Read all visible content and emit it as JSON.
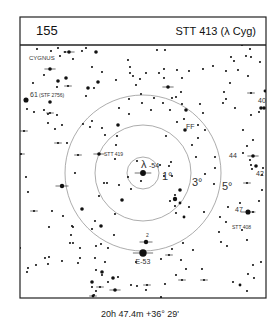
{
  "header": {
    "chart_number": "155",
    "title": "STT 413 (λ Cyg)"
  },
  "frame": {
    "left": 20,
    "top": 17,
    "right": 266,
    "header_bottom": 45,
    "bottom": 298
  },
  "center": {
    "x": 143,
    "y": 173
  },
  "circles": [
    {
      "label": "1°",
      "r": 16,
      "label_x": 162,
      "label_y": 180,
      "size": 11
    },
    {
      "label": "3°",
      "r": 48,
      "label_x": 192,
      "label_y": 186,
      "size": 11
    },
    {
      "label": "5°",
      "r": 78,
      "label_x": 222,
      "label_y": 190,
      "size": 11
    }
  ],
  "constellation_label": {
    "text": "CYGNUS",
    "x": 29,
    "y": 60
  },
  "labels": [
    {
      "text": "λ",
      "x": 141,
      "y": 168,
      "size": 11
    },
    {
      "text": "-54",
      "x": 149,
      "y": 168,
      "size": 7
    },
    {
      "text": "61",
      "x": 30,
      "y": 97,
      "size": 7
    },
    {
      "text": "(STF 2756)",
      "x": 39,
      "y": 97,
      "size": 5
    },
    {
      "text": "STT 419",
      "x": 104,
      "y": 156,
      "size": 5
    },
    {
      "text": "FF",
      "x": 186,
      "y": 129,
      "size": 7
    },
    {
      "text": "40",
      "x": 258,
      "y": 103,
      "size": 7
    },
    {
      "text": "44",
      "x": 229,
      "y": 158,
      "size": 7
    },
    {
      "text": "42",
      "x": 256,
      "y": 176,
      "size": 7
    },
    {
      "text": "47",
      "x": 235,
      "y": 212,
      "size": 7
    },
    {
      "text": "STT 408",
      "x": 232,
      "y": 229,
      "size": 5
    },
    {
      "text": "E-53",
      "x": 143,
      "y": 264,
      "size": 7,
      "anchor": "middle"
    },
    {
      "text": "2",
      "x": 146,
      "y": 237,
      "size": 5
    }
  ],
  "stars": [
    [
      143,
      173,
      3.5,
      1
    ],
    [
      141,
      181,
      1,
      0
    ],
    [
      137,
      161,
      1,
      0
    ],
    [
      128,
      177,
      1,
      0
    ],
    [
      160,
      165,
      1,
      0
    ],
    [
      172,
      176,
      1,
      0
    ],
    [
      164,
      176,
      1,
      0
    ],
    [
      171,
      162,
      1,
      0
    ],
    [
      169,
      166,
      1,
      0
    ],
    [
      131,
      189,
      1,
      0
    ],
    [
      119,
      185,
      1,
      0
    ],
    [
      107,
      183,
      1,
      0
    ],
    [
      122,
      200,
      2,
      0
    ],
    [
      99,
      196,
      1,
      0
    ],
    [
      115,
      214,
      1,
      0
    ],
    [
      62,
      186,
      2.5,
      1
    ],
    [
      82,
      209,
      2,
      0
    ],
    [
      63,
      216,
      1,
      0
    ],
    [
      52,
      211,
      1,
      0
    ],
    [
      34,
      211,
      1,
      1
    ],
    [
      49,
      227,
      1,
      0
    ],
    [
      73,
      227,
      1,
      0
    ],
    [
      71,
      235,
      1,
      0
    ],
    [
      72,
      226,
      1,
      0
    ],
    [
      101,
      226,
      2,
      0
    ],
    [
      114,
      235,
      1,
      0
    ],
    [
      92,
      229,
      1,
      0
    ],
    [
      95,
      221,
      1,
      0
    ],
    [
      104,
      183,
      1,
      0
    ],
    [
      115,
      159,
      1,
      0
    ],
    [
      99,
      154,
      2,
      1
    ],
    [
      180,
      190,
      2,
      0
    ],
    [
      175,
      199,
      2.5,
      0
    ],
    [
      180,
      203,
      1.5,
      0
    ],
    [
      175,
      206,
      1,
      0
    ],
    [
      170,
      201,
      1,
      0
    ],
    [
      175,
      195,
      1,
      0
    ],
    [
      189,
      207,
      1,
      0
    ],
    [
      184,
      217,
      1.5,
      0
    ],
    [
      176,
      213,
      1,
      0
    ],
    [
      204,
      212,
      1,
      0
    ],
    [
      205,
      174,
      1,
      0
    ],
    [
      215,
      157,
      1,
      0
    ],
    [
      215,
      168,
      1,
      0
    ],
    [
      214,
      184,
      1,
      0
    ],
    [
      196,
      157,
      1,
      0
    ],
    [
      192,
      145,
      1,
      0
    ],
    [
      198,
      125,
      1,
      0
    ],
    [
      185,
      130,
      2,
      0
    ],
    [
      198,
      138,
      1,
      0
    ],
    [
      205,
      130,
      1,
      0
    ],
    [
      203,
      113,
      1,
      0
    ],
    [
      184,
      119,
      1,
      0
    ],
    [
      200,
      104,
      1,
      0
    ],
    [
      186,
      110,
      2,
      0
    ],
    [
      182,
      104,
      1,
      0
    ],
    [
      170,
      110,
      1,
      0
    ],
    [
      163,
      103,
      1,
      0
    ],
    [
      151,
      110,
      1,
      0
    ],
    [
      166,
      136,
      1,
      0
    ],
    [
      177,
      122,
      1,
      0
    ],
    [
      176,
      97,
      1,
      0
    ],
    [
      172,
      98,
      1,
      0
    ],
    [
      154,
      98,
      1,
      0
    ],
    [
      142,
      103,
      1,
      0
    ],
    [
      141,
      94,
      1,
      0
    ],
    [
      129,
      99,
      1,
      0
    ],
    [
      119,
      108,
      1,
      0
    ],
    [
      129,
      114,
      1,
      0
    ],
    [
      118,
      125,
      2,
      0
    ],
    [
      117,
      136,
      1,
      0
    ],
    [
      116,
      145,
      1,
      0
    ],
    [
      105,
      135,
      1,
      0
    ],
    [
      102,
      128,
      1,
      0
    ],
    [
      92,
      121,
      1,
      0
    ],
    [
      90,
      127,
      1,
      0
    ],
    [
      83,
      124,
      1,
      0
    ],
    [
      78,
      155,
      1,
      1
    ],
    [
      75,
      173,
      1,
      0
    ],
    [
      67,
      143,
      1,
      0
    ],
    [
      58,
      143,
      1,
      1
    ],
    [
      55,
      129,
      1,
      0
    ],
    [
      62,
      125,
      1,
      0
    ],
    [
      57,
      115,
      1,
      0
    ],
    [
      50,
      102,
      2,
      0
    ],
    [
      48,
      123,
      1,
      0
    ],
    [
      44,
      110,
      1,
      0
    ],
    [
      50,
      113,
      1,
      1
    ],
    [
      48,
      114,
      1,
      0
    ],
    [
      50,
      69,
      2,
      1
    ],
    [
      58,
      81,
      2,
      0
    ],
    [
      66,
      78,
      2,
      0
    ],
    [
      88,
      88,
      2,
      0
    ],
    [
      86,
      96,
      1,
      0
    ],
    [
      68,
      86,
      1,
      1
    ],
    [
      57,
      87,
      1,
      0
    ],
    [
      44,
      75,
      1,
      0
    ],
    [
      33,
      83,
      1,
      0
    ],
    [
      26,
      100,
      3,
      0
    ],
    [
      27,
      109,
      1,
      0
    ],
    [
      34,
      112,
      1,
      0
    ],
    [
      24,
      131,
      1,
      1
    ],
    [
      21,
      154,
      1,
      1
    ],
    [
      26,
      177,
      1,
      0
    ],
    [
      28,
      192,
      1,
      0
    ],
    [
      62,
      186,
      1,
      0
    ],
    [
      20,
      248,
      1,
      0
    ],
    [
      28,
      268,
      1,
      0
    ],
    [
      27,
      272,
      1,
      0
    ],
    [
      36,
      265,
      1,
      0
    ],
    [
      48,
      264,
      1,
      0
    ],
    [
      45,
      258,
      1,
      0
    ],
    [
      49,
      257,
      1,
      0
    ],
    [
      62,
      261,
      1,
      0
    ],
    [
      70,
      243,
      1,
      0
    ],
    [
      73,
      243,
      1,
      0
    ],
    [
      80,
      248,
      1,
      0
    ],
    [
      78,
      263,
      1,
      0
    ],
    [
      80,
      258,
      1,
      0
    ],
    [
      95,
      258,
      1,
      0
    ],
    [
      96,
      270,
      1,
      0
    ],
    [
      105,
      262,
      1,
      0
    ],
    [
      102,
      275,
      1,
      0
    ],
    [
      102,
      272,
      2,
      0
    ],
    [
      96,
      291,
      1,
      0
    ],
    [
      93,
      296,
      1,
      1
    ],
    [
      108,
      282,
      1,
      0
    ],
    [
      118,
      277,
      1,
      0
    ],
    [
      113,
      278,
      2,
      0
    ],
    [
      108,
      248,
      1,
      0
    ],
    [
      101,
      244,
      1,
      0
    ],
    [
      96,
      246,
      1,
      0
    ],
    [
      92,
      282,
      2,
      0
    ],
    [
      92,
      287,
      1,
      0
    ],
    [
      100,
      287,
      1,
      1
    ],
    [
      115,
      290,
      2,
      1
    ],
    [
      115,
      290,
      1,
      0
    ],
    [
      136,
      262,
      1,
      0
    ],
    [
      146,
      242,
      2.5,
      1
    ],
    [
      143,
      253,
      4.5,
      1
    ],
    [
      169,
      255,
      1,
      1
    ],
    [
      161,
      259,
      1,
      0
    ],
    [
      172,
      249,
      1,
      0
    ],
    [
      183,
      243,
      1,
      0
    ],
    [
      181,
      260,
      1,
      0
    ],
    [
      182,
      280,
      1,
      1
    ],
    [
      165,
      284,
      1,
      0
    ],
    [
      146,
      290,
      1,
      0
    ],
    [
      147,
      285,
      1,
      1
    ],
    [
      137,
      286,
      1,
      0
    ],
    [
      131,
      285,
      1,
      0
    ],
    [
      93,
      296,
      1.5,
      0
    ],
    [
      94,
      295,
      1,
      0
    ],
    [
      107,
      299,
      1,
      0
    ],
    [
      161,
      297,
      1,
      0
    ],
    [
      176,
      275,
      1,
      0
    ],
    [
      202,
      269,
      1,
      0
    ],
    [
      204,
      280,
      1,
      1
    ],
    [
      186,
      269,
      1,
      0
    ],
    [
      193,
      250,
      1,
      0
    ],
    [
      233,
      282,
      1,
      0
    ],
    [
      248,
      274,
      1,
      0
    ],
    [
      240,
      285,
      1.5,
      0
    ],
    [
      237,
      303,
      1.5,
      1
    ],
    [
      247,
      291,
      1,
      0
    ],
    [
      253,
      265,
      1,
      0
    ],
    [
      254,
      278,
      1,
      0
    ],
    [
      261,
      262,
      1,
      0
    ],
    [
      221,
      242,
      1,
      0
    ],
    [
      227,
      246,
      1,
      0
    ],
    [
      219,
      232,
      1,
      0
    ],
    [
      247,
      240,
      1,
      0
    ],
    [
      220,
      217,
      1,
      0
    ],
    [
      242,
      230,
      1,
      0
    ],
    [
      248,
      212,
      3,
      1
    ],
    [
      226,
      222,
      1,
      0
    ],
    [
      228,
      207,
      1,
      0
    ],
    [
      240,
      203,
      1,
      0
    ],
    [
      253,
      212,
      1,
      0
    ],
    [
      259,
      201,
      1,
      0
    ],
    [
      247,
      183,
      1,
      1
    ],
    [
      262,
      190,
      1,
      0
    ],
    [
      262,
      175,
      1,
      0
    ],
    [
      256,
      166,
      2,
      0
    ],
    [
      251,
      165,
      1,
      0
    ],
    [
      252,
      169,
      1,
      0
    ],
    [
      263,
      168,
      1,
      0
    ],
    [
      253,
      156,
      2,
      1
    ],
    [
      250,
      160,
      1,
      0
    ],
    [
      243,
      153,
      1,
      0
    ],
    [
      247,
      146,
      1,
      0
    ],
    [
      253,
      140,
      1,
      0
    ],
    [
      243,
      130,
      1,
      0
    ],
    [
      261,
      108,
      2,
      0
    ],
    [
      259,
      112,
      1,
      0
    ],
    [
      251,
      115,
      1,
      0
    ],
    [
      251,
      93,
      1,
      1
    ],
    [
      226,
      99,
      1,
      0
    ],
    [
      223,
      103,
      1,
      0
    ],
    [
      224,
      92,
      1,
      0
    ],
    [
      235,
      108,
      1,
      0
    ],
    [
      230,
      83,
      1,
      0
    ],
    [
      238,
      70,
      1,
      0
    ],
    [
      248,
      76,
      1,
      0
    ],
    [
      226,
      71,
      1,
      0
    ],
    [
      265,
      91,
      1.5,
      0
    ],
    [
      264,
      108,
      2,
      0
    ],
    [
      260,
      62,
      1,
      0
    ],
    [
      251,
      57,
      1,
      0
    ],
    [
      246,
      56,
      1,
      0
    ],
    [
      242,
      45,
      1,
      0
    ],
    [
      250,
      49,
      1,
      0
    ],
    [
      213,
      66,
      1,
      0
    ],
    [
      203,
      69,
      1,
      0
    ],
    [
      189,
      71,
      1,
      0
    ],
    [
      177,
      70,
      1,
      0
    ],
    [
      164,
      69,
      1,
      0
    ],
    [
      159,
      73,
      1,
      0
    ],
    [
      168,
      87,
      2,
      1
    ],
    [
      164,
      78,
      1,
      0
    ],
    [
      181,
      92,
      1,
      0
    ],
    [
      130,
      73,
      1,
      0
    ],
    [
      140,
      79,
      1,
      0
    ],
    [
      136,
      85,
      1,
      0
    ],
    [
      116,
      80,
      1,
      0
    ],
    [
      102,
      72,
      1,
      0
    ],
    [
      92,
      67,
      1,
      0
    ],
    [
      94,
      88,
      1,
      0
    ],
    [
      98,
      82,
      2,
      0
    ],
    [
      82,
      51,
      1,
      0
    ],
    [
      86,
      48,
      1,
      0
    ],
    [
      65,
      52,
      1,
      0
    ],
    [
      69,
      52,
      2,
      1
    ],
    [
      73,
      59,
      1,
      0
    ],
    [
      51,
      51,
      1,
      0
    ],
    [
      37,
      49,
      1,
      0
    ],
    [
      60,
      56,
      1,
      0
    ],
    [
      58,
      48,
      1,
      0
    ],
    [
      96,
      52,
      2,
      0
    ],
    [
      157,
      50,
      1,
      0
    ],
    [
      165,
      50,
      1,
      0
    ],
    [
      128,
      60,
      1,
      0
    ],
    [
      130,
      67,
      1,
      0
    ],
    [
      133,
      76,
      1,
      0
    ],
    [
      146,
      73,
      1,
      0
    ],
    [
      182,
      78,
      1,
      0
    ],
    [
      231,
      57,
      1,
      0
    ],
    [
      234,
      61,
      1,
      0
    ]
  ],
  "footer": {
    "coordinates": "20h 47.4m  +36° 29'"
  }
}
